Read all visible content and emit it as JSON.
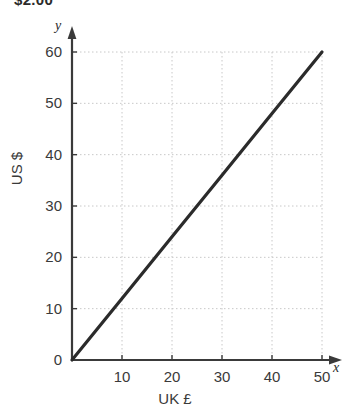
{
  "clipped_header": {
    "text": "$2.00"
  },
  "chart_data": {
    "type": "line",
    "title": "",
    "xlabel": "UK £",
    "ylabel": "US $",
    "x_axis_variable": "y",
    "y_axis_variable": "x",
    "xlim": [
      0,
      50
    ],
    "ylim": [
      0,
      60
    ],
    "xticks": [
      0,
      10,
      20,
      30,
      40,
      50
    ],
    "yticks": [
      0,
      10,
      20,
      30,
      40,
      50,
      60
    ],
    "xtick_labels": [
      "0",
      "10",
      "20",
      "30",
      "40",
      "50"
    ],
    "ytick_labels": [
      "0",
      "10",
      "20",
      "30",
      "40",
      "50",
      "60"
    ],
    "grid": true,
    "legend": "none",
    "series": [
      {
        "name": "conversion",
        "slope": 1.2,
        "x": [
          0,
          10,
          20,
          30,
          40,
          50
        ],
        "values": [
          0,
          12,
          24,
          36,
          48,
          60
        ]
      }
    ],
    "axis_arrows": {
      "x": "right",
      "y": "up"
    },
    "colors": {
      "line": "#2b2b2b",
      "axis": "#3a3a3a",
      "grid": "#c8c8c8",
      "background": "#ffffff",
      "text": "#3a3a3a"
    }
  }
}
